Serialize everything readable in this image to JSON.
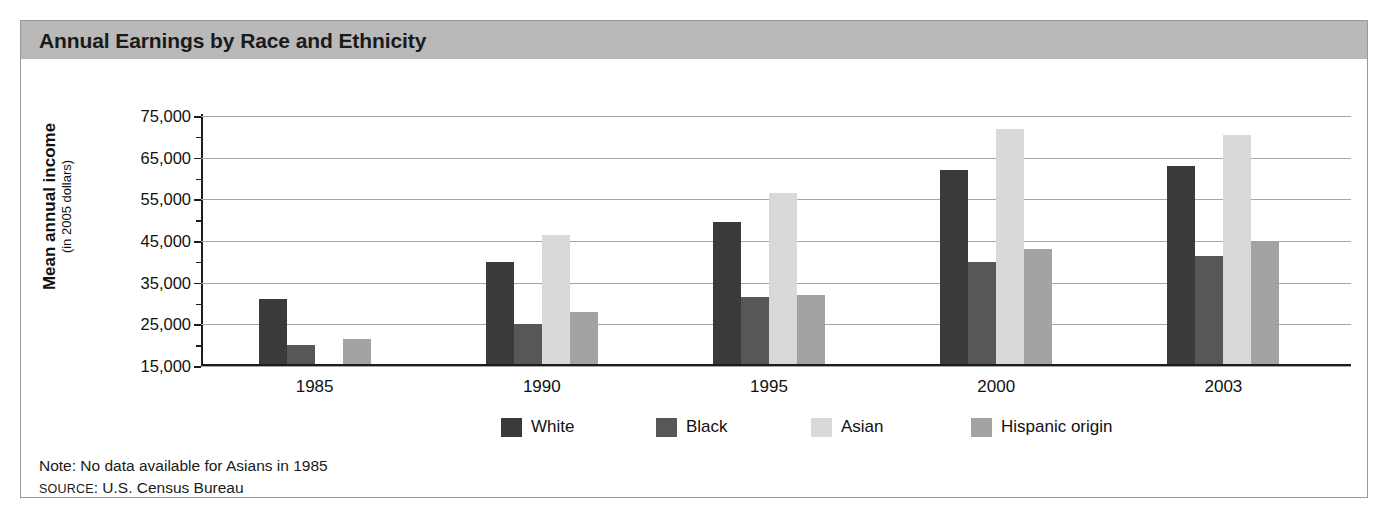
{
  "figure": {
    "title": "Annual Earnings by Race and Ethnicity",
    "note": "Note: No data available for Asians in 1985",
    "source_word": "SOURCE",
    "source_rest": ": U.S. Census Bureau"
  },
  "axis": {
    "y_title_line1": "Mean annual income",
    "y_title_line2": "(in 2005 dollars)",
    "y_ticklabels": [
      "75,000",
      "65,000",
      "55,000",
      "45,000",
      "35,000",
      "25,000",
      "15,000"
    ]
  },
  "legend": {
    "items": [
      {
        "label": "White",
        "color": "#3a3a3a"
      },
      {
        "label": "Black",
        "color": "#575757"
      },
      {
        "label": "Asian",
        "color": "#d9d9d9"
      },
      {
        "label": "Hispanic origin",
        "color": "#a3a3a3"
      }
    ]
  },
  "chart_data": {
    "type": "bar",
    "title": "Annual Earnings by Race and Ethnicity",
    "xlabel": "",
    "ylabel": "Mean annual income (in 2005 dollars)",
    "ylim": [
      15000,
      75000
    ],
    "ytick_step": 10000,
    "yminor_step": 5000,
    "grid": true,
    "legend_position": "bottom",
    "categories": [
      "1985",
      "1990",
      "1995",
      "2000",
      "2003"
    ],
    "series": [
      {
        "name": "White",
        "color": "#3a3a3a",
        "values": [
          30500,
          39500,
          49000,
          61500,
          62500
        ]
      },
      {
        "name": "Black",
        "color": "#575757",
        "values": [
          19500,
          24500,
          31000,
          39500,
          41000
        ]
      },
      {
        "name": "Asian",
        "color": "#d9d9d9",
        "values": [
          null,
          46000,
          56000,
          71500,
          70000
        ]
      },
      {
        "name": "Hispanic origin",
        "color": "#a3a3a3",
        "values": [
          21000,
          27500,
          31500,
          42500,
          44500
        ]
      }
    ],
    "note": "Note: No data available for Asians in 1985",
    "source": "SOURCE: U.S. Census Bureau"
  }
}
